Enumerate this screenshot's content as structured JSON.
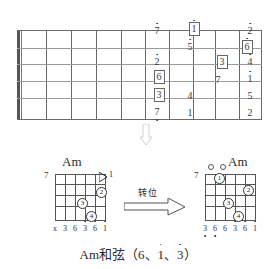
{
  "fretboard": {
    "name": "guitar-fretboard-note-map",
    "strings": 6,
    "frets": 10,
    "notes": [
      {
        "id": "n-7low-s1",
        "text": "7",
        "dot": "up",
        "boxed": false,
        "x": 150,
        "y": 26,
        "string": 1,
        "fret": 7
      },
      {
        "id": "n-1-box-s1",
        "text": "1",
        "dot": "up",
        "boxed": true,
        "x": 187,
        "y": 22,
        "string": 1,
        "fret": 8
      },
      {
        "id": "n-2-s1",
        "text": "2",
        "dot": "up",
        "boxed": false,
        "x": 243,
        "y": 26,
        "string": 1,
        "fret": 10
      },
      {
        "id": "n-5-s2",
        "text": "5",
        "dot": "up",
        "boxed": false,
        "x": 183,
        "y": 42,
        "string": 2,
        "fret": 8
      },
      {
        "id": "n-6-box-s2",
        "text": "6",
        "dot": "up",
        "boxed": true,
        "x": 240,
        "y": 40,
        "string": 2,
        "fret": 10
      },
      {
        "id": "n-2-s3",
        "text": "2",
        "dot": "up",
        "boxed": false,
        "x": 150,
        "y": 57,
        "string": 3,
        "fret": 7
      },
      {
        "id": "n-3-box-s3",
        "text": "3",
        "dot": "none",
        "boxed": true,
        "x": 215,
        "y": 55,
        "string": 3,
        "fret": 9
      },
      {
        "id": "n-4-s3",
        "text": "4",
        "dot": "up",
        "boxed": false,
        "x": 243,
        "y": 57,
        "string": 3,
        "fret": 10
      },
      {
        "id": "n-6-box-s4",
        "text": "6",
        "dot": "none",
        "boxed": true,
        "x": 152,
        "y": 70,
        "string": 4,
        "fret": 7
      },
      {
        "id": "n-7-s4",
        "text": "7",
        "dot": "none",
        "boxed": false,
        "x": 211,
        "y": 75,
        "string": 4,
        "fret": 9
      },
      {
        "id": "n-1-s4",
        "text": "1",
        "dot": "up",
        "boxed": false,
        "x": 243,
        "y": 74,
        "string": 4,
        "fret": 10
      },
      {
        "id": "n-3-box-s5",
        "text": "3",
        "dot": "none",
        "boxed": true,
        "x": 152,
        "y": 88,
        "string": 5,
        "fret": 7
      },
      {
        "id": "n-4-s5",
        "text": "4",
        "dot": "none",
        "boxed": false,
        "x": 183,
        "y": 91,
        "string": 5,
        "fret": 8
      },
      {
        "id": "n-5-s5",
        "text": "5",
        "dot": "none",
        "boxed": false,
        "x": 243,
        "y": 91,
        "string": 5,
        "fret": 10
      },
      {
        "id": "n-7-s6",
        "text": "7",
        "dot": "down",
        "boxed": false,
        "x": 150,
        "y": 107,
        "string": 6,
        "fret": 7
      },
      {
        "id": "n-1-s6",
        "text": "1",
        "dot": "none",
        "boxed": false,
        "x": 183,
        "y": 108,
        "string": 6,
        "fret": 8
      },
      {
        "id": "n-2-s6",
        "text": "2",
        "dot": "none",
        "boxed": false,
        "x": 243,
        "y": 108,
        "string": 6,
        "fret": 10
      }
    ]
  },
  "down_arrow": {
    "name": "down-arrow",
    "direction": "down"
  },
  "chord_left": {
    "title": "Am",
    "fret_number": "7",
    "barre_label": "1",
    "fingers": [
      {
        "label": "2",
        "x": 96,
        "y": 187
      },
      {
        "label": "3",
        "x": 77,
        "y": 198
      },
      {
        "label": "4",
        "x": 86,
        "y": 211
      }
    ],
    "string_labels": [
      {
        "text": "x",
        "dot": "none"
      },
      {
        "text": "3",
        "dot": "none"
      },
      {
        "text": "6",
        "dot": "none"
      },
      {
        "text": "3",
        "dot": "up"
      },
      {
        "text": "6",
        "dot": "up"
      },
      {
        "text": "1",
        "dot": "up"
      }
    ]
  },
  "chord_right": {
    "title": "Am",
    "fret_number": "7",
    "open_strings": 2,
    "fingers": [
      {
        "label": "1",
        "x": 214,
        "y": 173
      },
      {
        "label": "2",
        "x": 243,
        "y": 185
      },
      {
        "label": "3",
        "x": 223,
        "y": 198
      },
      {
        "label": "4",
        "x": 233,
        "y": 211
      }
    ],
    "string_labels": [
      {
        "text": "3",
        "dot": "down"
      },
      {
        "text": "6",
        "dot": "down"
      },
      {
        "text": "6",
        "dot": "none"
      },
      {
        "text": "3",
        "dot": "up"
      },
      {
        "text": "6",
        "dot": "up"
      },
      {
        "text": "1",
        "dot": "up"
      }
    ]
  },
  "inversion": {
    "label": "转位",
    "name": "inversion-arrow"
  },
  "caption": {
    "prefix": "Am和弦（6、",
    "note1": "1",
    "sep": "、",
    "note2": "3",
    "suffix": "）"
  }
}
